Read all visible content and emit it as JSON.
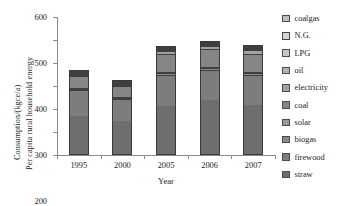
{
  "chart_data": {
    "type": "bar",
    "stacked": true,
    "title": "",
    "xlabel": "Year",
    "ylabel": "Consumption/(kgce/a)",
    "ylabel_line2": "Per capita rural household energy",
    "categories": [
      "1995",
      "2000",
      "2005",
      "2006",
      "2007"
    ],
    "ylim": [
      0,
      600
    ],
    "yticks": [
      0,
      100,
      200,
      300,
      400,
      500,
      600
    ],
    "ytick_labels": [
      "0",
      "100",
      "200",
      "300",
      "400",
      "500",
      "600"
    ],
    "grid": false,
    "legend_position": "right",
    "series": [
      {
        "name": "straw",
        "color": "#6e6e6e",
        "values": [
          178,
          156,
          216,
          246,
          221
        ]
      },
      {
        "name": "firewood",
        "color": "#7d7d7d",
        "values": [
          117,
          100,
          138,
          133,
          133
        ]
      },
      {
        "name": "biogas",
        "color": "#8c8c8c",
        "values": [
          4,
          4,
          8,
          8,
          8
        ]
      },
      {
        "name": "solar",
        "color": "#9a9a9a",
        "values": [
          2,
          2,
          4,
          4,
          4
        ]
      },
      {
        "name": "coal",
        "color": "#868686",
        "values": [
          55,
          52,
          82,
          82,
          80
        ]
      },
      {
        "name": "electricity",
        "color": "#a2a2a2",
        "values": [
          6,
          7,
          15,
          16,
          19
        ]
      },
      {
        "name": "oil",
        "color": "#b4b4b4",
        "values": [
          3,
          2,
          5,
          4,
          5
        ]
      },
      {
        "name": "LPG",
        "color": "#c6c6c6",
        "values": [
          3,
          2,
          3,
          2,
          6
        ]
      },
      {
        "name": "N.G.",
        "color": "#d6d6d6",
        "values": [
          1,
          1,
          2,
          1,
          2
        ]
      },
      {
        "name": "coalgas",
        "color": "#bdbdbd",
        "values": [
          1,
          1,
          2,
          1,
          2
        ]
      }
    ],
    "totals": [
      370,
      327,
      475,
      497,
      480
    ]
  },
  "legend": {
    "items": [
      {
        "label": "coalgas",
        "color": "#bdbdbd"
      },
      {
        "label": "N.G.",
        "color": "#d6d6d6"
      },
      {
        "label": "LPG",
        "color": "#c6c6c6"
      },
      {
        "label": "oil",
        "color": "#b4b4b4"
      },
      {
        "label": "electricity",
        "color": "#a2a2a2"
      },
      {
        "label": "coal",
        "color": "#868686"
      },
      {
        "label": "solar",
        "color": "#9a9a9a"
      },
      {
        "label": "biogas",
        "color": "#8c8c8c"
      },
      {
        "label": "firewood",
        "color": "#7d7d7d"
      },
      {
        "label": "straw",
        "color": "#6e6e6e"
      }
    ]
  }
}
